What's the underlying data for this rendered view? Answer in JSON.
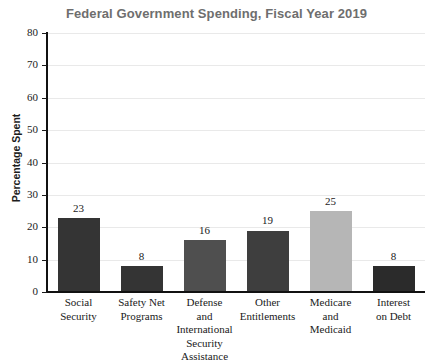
{
  "chart_data": {
    "type": "bar",
    "title": "Federal Government Spending, Fiscal Year 2019",
    "xlabel": "",
    "ylabel": "Percentage Spent",
    "ylim": [
      0,
      80
    ],
    "ytick_step": 10,
    "ytick_labels": [
      "0",
      "10",
      "20",
      "30",
      "40",
      "50",
      "60",
      "70",
      "80"
    ],
    "grid": true,
    "legend": false,
    "categories": [
      "Social Security",
      "Safety Net Programs",
      "Defense and International Security Assistance",
      "Other Entitlements",
      "Medicare and Medicaid",
      "Interest on Debt"
    ],
    "category_lines": [
      [
        "Social",
        "Security"
      ],
      [
        "Safety Net",
        "Programs"
      ],
      [
        "Defense",
        "and",
        "International",
        "Security",
        "Assistance"
      ],
      [
        "Other",
        "Entitlements"
      ],
      [
        "Medicare",
        "and",
        "Medicaid"
      ],
      [
        "Interest",
        "on Debt"
      ]
    ],
    "values": [
      23,
      8,
      16,
      19,
      25,
      8
    ],
    "value_labels": [
      "23",
      "8",
      "16",
      "19",
      "25",
      "8"
    ],
    "bar_colors": [
      "#343434",
      "#343434",
      "#4f4f4f",
      "#3e3e3e",
      "#b6b6b6",
      "#2b2b2b"
    ]
  },
  "style": {
    "title_color": "#6e6e6e",
    "axis_color": "#111111",
    "grid_color": "#e9e9e9",
    "text_color": "#1a1a1a",
    "background": "#ffffff"
  }
}
